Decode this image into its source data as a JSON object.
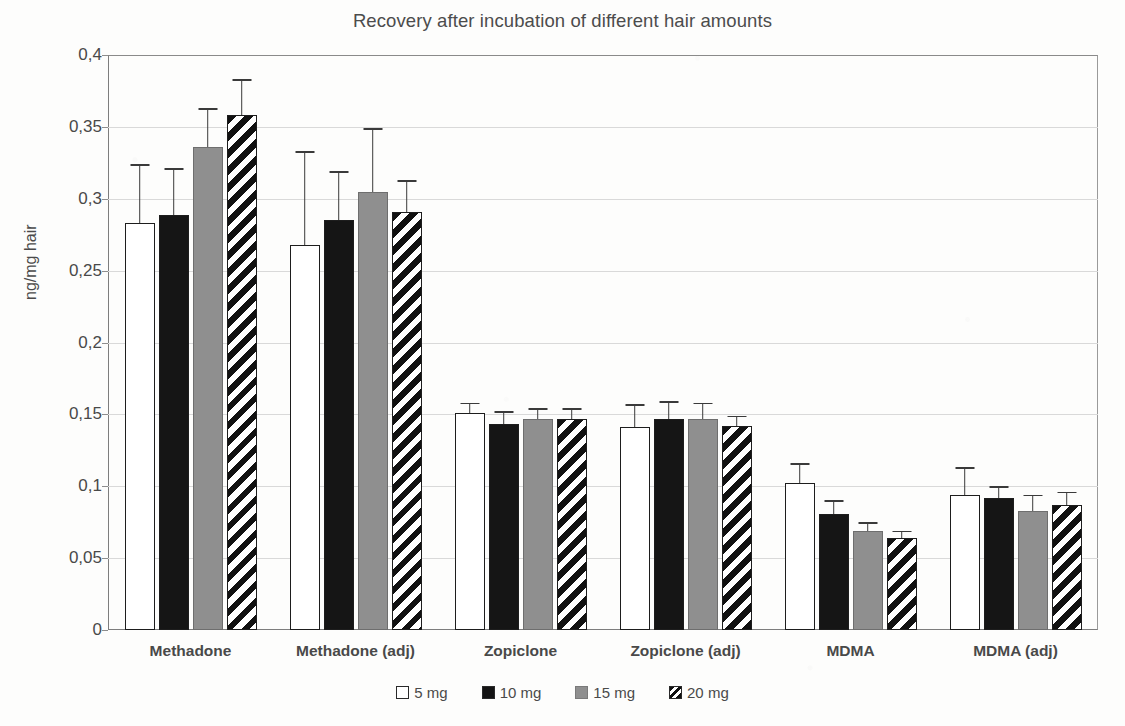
{
  "chart_data": {
    "type": "bar",
    "title": "Recovery after incubation of different hair amounts",
    "xlabel": "",
    "ylabel": "ng/mg hair",
    "ylim": [
      0,
      0.4
    ],
    "ytick_labels": [
      "0,4",
      "0,35",
      "0,3",
      "0,25",
      "0,2",
      "0,15",
      "0,1",
      "0,05",
      "0"
    ],
    "ytick_values": [
      0.4,
      0.35,
      0.3,
      0.25,
      0.2,
      0.15,
      0.1,
      0.05,
      0
    ],
    "grid": true,
    "legend_position": "bottom",
    "decimal_separator": ",",
    "categories": [
      "Methadone",
      "Methadone (adj)",
      "Zopiclone",
      "Zopiclone (adj)",
      "MDMA",
      "MDMA (adj)"
    ],
    "series": [
      {
        "name": "5 mg",
        "style": "white-outline",
        "color": "#ffffff",
        "values": [
          0.283,
          0.268,
          0.151,
          0.141,
          0.102,
          0.094
        ],
        "errors": [
          0.04,
          0.064,
          0.006,
          0.015,
          0.013,
          0.018
        ]
      },
      {
        "name": "10 mg",
        "style": "solid-black",
        "color": "#151515",
        "values": [
          0.289,
          0.285,
          0.143,
          0.147,
          0.081,
          0.092
        ],
        "errors": [
          0.031,
          0.033,
          0.008,
          0.011,
          0.008,
          0.007
        ]
      },
      {
        "name": "15 mg",
        "style": "solid-gray",
        "color": "#8f8f8f",
        "values": [
          0.336,
          0.305,
          0.147,
          0.147,
          0.069,
          0.083
        ],
        "errors": [
          0.026,
          0.043,
          0.006,
          0.01,
          0.005,
          0.01
        ]
      },
      {
        "name": "20 mg",
        "style": "diagonal-hatch",
        "color": "#111111",
        "values": [
          0.358,
          0.291,
          0.147,
          0.142,
          0.064,
          0.087
        ],
        "errors": [
          0.024,
          0.021,
          0.006,
          0.006,
          0.004,
          0.008
        ]
      }
    ]
  },
  "legend": {
    "items": [
      {
        "label": "5 mg"
      },
      {
        "label": "10 mg"
      },
      {
        "label": "15 mg"
      },
      {
        "label": "20 mg"
      }
    ]
  }
}
